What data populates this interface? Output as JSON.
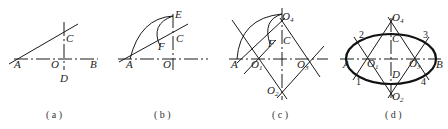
{
  "figures": [
    {
      "id": "a",
      "caption": "( a )",
      "labels": {
        "A": "A",
        "O": "O",
        "B": "B",
        "C": "C",
        "D": "D"
      }
    },
    {
      "id": "b",
      "caption": "( b )",
      "labels": {
        "A": "A",
        "O": "O",
        "C": "C",
        "E": "E",
        "F": "F"
      }
    },
    {
      "id": "c",
      "caption": "( c )",
      "labels": {
        "A": "A",
        "O": "O",
        "C": "C",
        "F": "F",
        "O1": "1",
        "O2": "2",
        "O3": "3",
        "O4": "4"
      }
    },
    {
      "id": "d",
      "caption": "( d )",
      "labels": {
        "A": "A",
        "B": "B",
        "C": "C",
        "D": "D",
        "O": "O",
        "O1": "1",
        "O2": "2",
        "O3": "3",
        "O4": "4",
        "p1": "1",
        "p2": "2",
        "p3": "3",
        "p4": "4"
      }
    }
  ],
  "colors": {
    "stroke": "#1a1a1a",
    "background": "#ffffff"
  }
}
